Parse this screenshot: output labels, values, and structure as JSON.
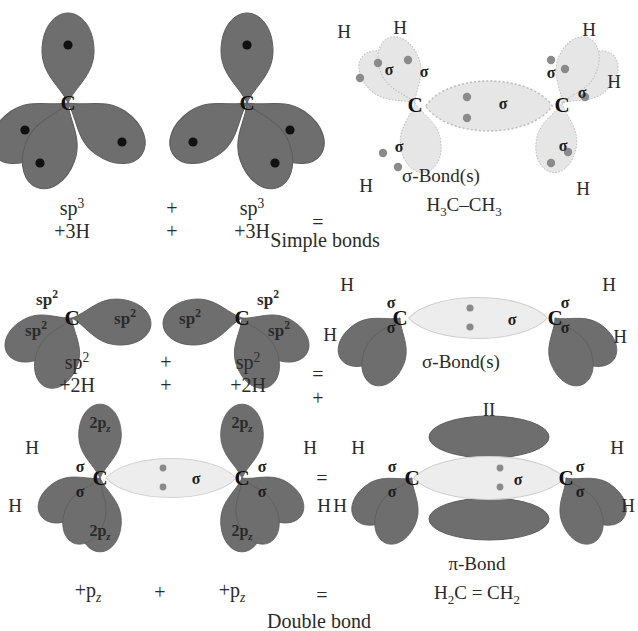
{
  "figure": {
    "colors": {
      "dark_orbital": "#6e6e6e",
      "light_orbital": "#e6e6e6",
      "dark_orbital_edge": "#5a5a5a",
      "light_orbital_edge": "#b9b9b9",
      "electron_dark": "#111111",
      "electron_light": "#8a8a8a",
      "text": "#2a2a2a",
      "background": "#ffffff"
    }
  },
  "rows": [
    {
      "id": "row-simple-bonds",
      "caption": "Simple bonds",
      "operator_plus": "+",
      "operator_equals": "=",
      "left_reactant": {
        "label_top": "sp3",
        "label_sup": "3",
        "label_base": "sp",
        "label_bottom": "+3H",
        "hybrid": "sp3"
      },
      "right_reactant": {
        "label_top": "sp3",
        "label_sup": "3",
        "label_base": "sp",
        "label_bottom": "+3H",
        "hybrid": "sp3"
      },
      "product": {
        "bond_label": "σ-Bond(s)",
        "formula": "H3C–CH3",
        "formula_parts": [
          "H",
          "3",
          "C–CH",
          "3"
        ],
        "atom_label": "C",
        "hydrogens": [
          "H",
          "H",
          "H",
          "H",
          "H",
          "H"
        ],
        "sigma_label": "σ",
        "sigma_count": 7
      }
    },
    {
      "id": "row-sp2-sigma",
      "caption": "",
      "operator_plus": "+",
      "operator_equals": "=",
      "operator_plus_below": "+",
      "left_reactant": {
        "label_base": "sp",
        "label_sup": "2",
        "label_bottom": "+2H",
        "orbital_labels": [
          "sp2",
          "sp2",
          "sp2"
        ]
      },
      "right_reactant": {
        "label_base": "sp",
        "label_sup": "2",
        "label_bottom": "+2H",
        "orbital_labels": [
          "sp2",
          "sp2",
          "sp2"
        ]
      },
      "product": {
        "bond_label": "σ-Bond(s)",
        "atom_label": "C",
        "hydrogens": [
          "H",
          "H",
          "H",
          "H"
        ],
        "sigma_label": "σ"
      }
    },
    {
      "id": "row-double-bond",
      "caption": "Double bond",
      "operator_plus": "+",
      "operator_equals": "=",
      "operator_equals_below": "=",
      "left_reactant": {
        "label_bottom": "+pz",
        "orbital_labels": [
          "2pz",
          "2pz"
        ],
        "hydrogens": [
          "H",
          "H"
        ],
        "sigma_label": "σ",
        "atom_label": "C"
      },
      "right_reactant": {
        "label_bottom": "+pz",
        "orbital_labels": [
          "2pz",
          "2pz"
        ],
        "hydrogens": [
          "H",
          "H"
        ],
        "sigma_label": "σ",
        "atom_label": "C"
      },
      "product": {
        "pi_top_label": "II",
        "bond_label": "π-Bond",
        "formula": "H2C = CH2",
        "atom_label": "C",
        "hydrogens": [
          "H",
          "H",
          "H",
          "H"
        ],
        "sigma_label": "σ"
      }
    }
  ],
  "text_tokens": {
    "sp": "sp",
    "two": "2",
    "three": "3",
    "plus3H": "+3H",
    "plus2H": "+2H",
    "plus_pz": "+p",
    "z": "z",
    "twopz": "2p",
    "H": "H",
    "C": "C",
    "sigma": "σ",
    "pi": "π",
    "sigma_bond_s": "σ-Bond(s)",
    "pi_bond": "π-Bond",
    "ethane": "H₃C–CH₃",
    "ethene": "H₂C = CH₂",
    "II": "II",
    "plus": "+",
    "equals": "=",
    "simple_bonds": "Simple bonds",
    "double_bond": "Double bond"
  }
}
